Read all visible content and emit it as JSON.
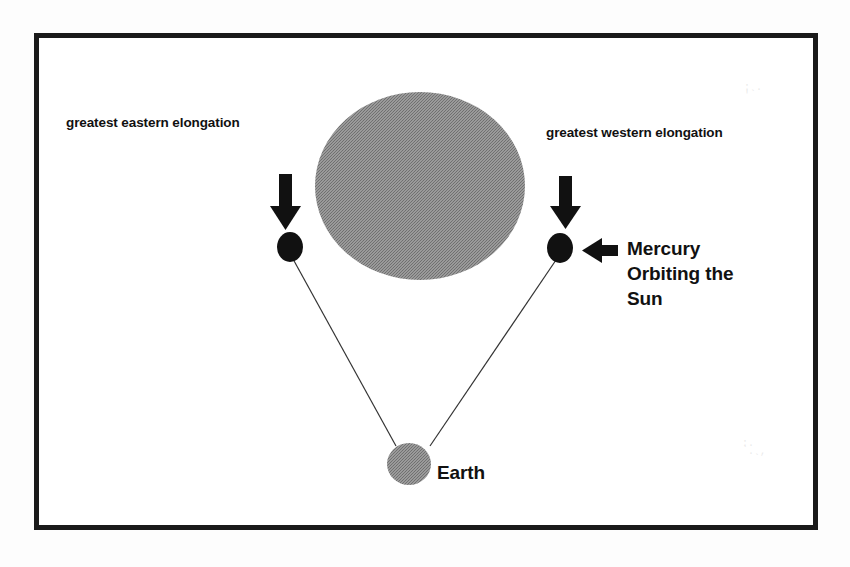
{
  "diagram": {
    "background_color": "#ffffff",
    "frame": {
      "border_color": "#1a1a1a",
      "border_width_px": 5
    },
    "labels": {
      "greatest_eastern_elongation": "greatest eastern elongation",
      "greatest_western_elongation": "greatest western elongation",
      "mercury_orbiting_the_sun": "Mercury\nOrbiting the\nSun",
      "earth": "Earth"
    },
    "bodies": [
      {
        "name": "sun",
        "shape": "ellipse",
        "cx": 420,
        "cy": 186,
        "rx": 105,
        "ry": 94,
        "fill": "#8a8a8a"
      },
      {
        "name": "mercury-eastern-elongation",
        "shape": "ellipse",
        "cx": 290,
        "cy": 247,
        "rx": 13,
        "ry": 15,
        "fill": "#111111"
      },
      {
        "name": "mercury-western-elongation",
        "shape": "ellipse",
        "cx": 560,
        "cy": 248,
        "rx": 13,
        "ry": 15,
        "fill": "#111111"
      },
      {
        "name": "earth",
        "shape": "ellipse",
        "cx": 409,
        "cy": 464,
        "rx": 22,
        "ry": 21,
        "fill": "#8a8a8a"
      }
    ],
    "sight_lines": [
      {
        "name": "earth-to-eastern-mercury",
        "x1": 293,
        "y1": 259,
        "x2": 396,
        "y2": 446,
        "stroke": "#333333",
        "stroke_width": 1.2
      },
      {
        "name": "earth-to-western-mercury",
        "x1": 556,
        "y1": 260,
        "x2": 430,
        "y2": 446,
        "stroke": "#333333",
        "stroke_width": 1.2
      }
    ],
    "arrows": [
      {
        "name": "arrow-down-eastern",
        "direction": "down",
        "x": 286,
        "y_start": 174,
        "y_end": 228,
        "color": "#111111"
      },
      {
        "name": "arrow-down-western",
        "direction": "down",
        "x": 566,
        "y_start": 176,
        "y_end": 228,
        "color": "#111111"
      },
      {
        "name": "arrow-left-mercury-callout",
        "direction": "left",
        "x_start": 618,
        "x_end": 582,
        "y": 251,
        "color": "#111111"
      }
    ],
    "speckles": {
      "top_right": ": .\n'`",
      "bottom_right": ":.\n`. ,\n  `"
    }
  }
}
